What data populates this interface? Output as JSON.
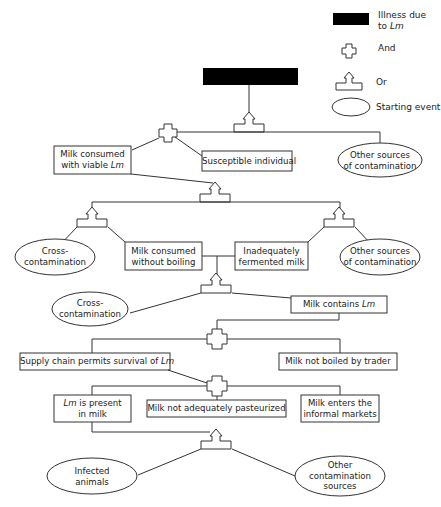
{
  "legend": {
    "illness": {
      "line1": "Illness due",
      "line2_prefix": "to ",
      "line2_italic": "Lm"
    },
    "and": "And",
    "or": "Or",
    "starting_event": "Starting event"
  },
  "top_event": {
    "label": "Illness due to Lm",
    "color": "#000000"
  },
  "nodes": {
    "milk_viable": {
      "line1": "Milk consumed",
      "line2_prefix": "with viable ",
      "line2_italic": "Lm"
    },
    "susceptible": "Susceptible individual",
    "other_sources_1": {
      "line1": "Other sources",
      "line2": "of contamination"
    },
    "cross_1": {
      "line1": "Cross-",
      "line2": "contamination"
    },
    "no_boiling": {
      "line1": "Milk consumed",
      "line2": "without boiling"
    },
    "fermented": {
      "line1": "Inadequately",
      "line2": "fermented milk"
    },
    "other_sources_2": {
      "line1": "Other sources",
      "line2": "of contamination"
    },
    "cross_2": {
      "line1": "Cross-",
      "line2": "contamination"
    },
    "milk_contains": {
      "prefix": "Milk contains ",
      "italic": "Lm"
    },
    "supply_chain": {
      "prefix": "Supply chain permits survival of ",
      "italic": "Lm"
    },
    "not_boiled_trader": "Milk not boiled by trader",
    "lm_present": {
      "line1_italic": "Lm",
      "line1_suffix": " is present",
      "line2": "in milk"
    },
    "not_pasteurized": "Milk not adequately pasteurized",
    "informal": {
      "line1": "Milk enters the",
      "line2": "informal markets"
    },
    "infected": {
      "line1": "Infected",
      "line2": "animals"
    },
    "other_contam": {
      "line1": "Other",
      "line2": "contamination",
      "line3": "sources"
    }
  }
}
